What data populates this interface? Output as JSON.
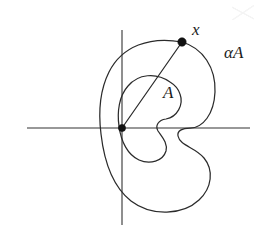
{
  "figure": {
    "labels": {
      "point_x": "x",
      "outer_set": "αA",
      "inner_set": "A"
    },
    "colors": {
      "curve_stroke": "#2b2b2b",
      "axis_stroke": "#333333",
      "dot_fill": "#111111",
      "background": "#ffffff"
    },
    "geometry": {
      "origin": {
        "x": 122,
        "y": 128
      },
      "point_x": {
        "x": 182,
        "y": 42
      },
      "axis_horizontal": {
        "x1": 27,
        "y1": 128,
        "x2": 250,
        "y2": 128
      },
      "axis_vertical": {
        "x1": 122,
        "y1": 30,
        "x2": 122,
        "y2": 225
      },
      "radius_segment": {
        "x1": 122,
        "y1": 128,
        "x2": 182,
        "y2": 42
      },
      "dot_radius": 3.6
    },
    "curves": {
      "outer_alpha_a": "M182,42 C150,36 122,46 109,72 C98,94 99,118 101,134 C104,160 112,186 131,201 C152,217 183,215 199,200 C212,188 214,170 204,158 C195,147 180,146 178,136 C177,131 182,128 190,128 C203,128 214,114 215,92 C216,68 203,48 182,42 Z",
      "inner_a": "M170,82 C156,72 138,74 128,86 C119,96 117,112 119,126 C121,142 128,155 139,160 C150,165 163,161 166,151 C168,143 162,137 158,131 C155,126 158,120 166,119 C177,117 184,105 180,94 C178,88 175,85 170,82 Z"
    }
  }
}
